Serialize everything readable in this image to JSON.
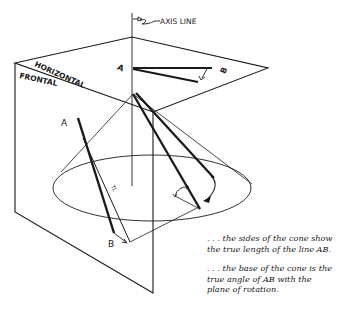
{
  "labels": {
    "axis_line": "AXIS LINE",
    "horizontal_plane": "HORIZONTAL",
    "frontal_plane": "FRONTAL",
    "point_a_top": "A",
    "point_b_top": "B",
    "point_a_front": "A",
    "point_b_front": "B",
    "true_length": "TL"
  },
  "captions": [
    {
      "text": ". . . the sides of the cone show the true length of the line AB."
    },
    {
      "text": ". . . the base of the cone is the true angle of AB with the plane of rotation."
    }
  ],
  "colors": {
    "ink": "#1a1a1a",
    "background": "#ffffff"
  }
}
